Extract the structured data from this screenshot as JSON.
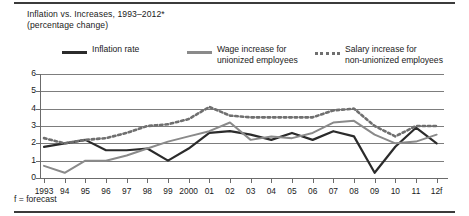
{
  "figure": {
    "title_line1": "Inflation vs. Increases, 1993–2012*",
    "title_line2": "(percentage change)",
    "footnote": "f = forecast"
  },
  "legend": {
    "items": [
      {
        "key": "line-solid-dark",
        "label_line1": "Inflation rate",
        "label_line2": "",
        "color": "#2b2b2b"
      },
      {
        "key": "line-solid-gray",
        "label_line1": "Wage increase for",
        "label_line2": "unionized employees",
        "color": "#8a8a8a"
      },
      {
        "key": "line-dotted-gray",
        "label_line1": "Salary increase for",
        "label_line2": "non-unionized employees",
        "color": "#6f6f6f"
      }
    ]
  },
  "chart_data": {
    "type": "line",
    "title": "Inflation vs. Increases, 1993–2012*",
    "subtitle": "(percentage change)",
    "xlabel": "",
    "ylabel": "",
    "ylim": [
      0,
      6
    ],
    "yticks": [
      0,
      1,
      2,
      3,
      4,
      5,
      6
    ],
    "grid": true,
    "legend_position": "top",
    "categories": [
      "1993",
      "94",
      "95",
      "96",
      "97",
      "98",
      "99",
      "2000",
      "01",
      "02",
      "03",
      "04",
      "05",
      "06",
      "07",
      "08",
      "09",
      "10",
      "11",
      "12f"
    ],
    "x": [
      1993,
      1994,
      1995,
      1996,
      1997,
      1998,
      1999,
      2000,
      2001,
      2002,
      2003,
      2004,
      2005,
      2006,
      2007,
      2008,
      2009,
      2010,
      2011,
      2012
    ],
    "series": [
      {
        "name": "Inflation rate",
        "style": "solid",
        "color": "#2b2b2b",
        "values": [
          1.8,
          2.0,
          2.2,
          1.6,
          1.6,
          1.7,
          1.0,
          1.7,
          2.6,
          2.7,
          2.5,
          2.2,
          2.6,
          2.2,
          2.7,
          2.4,
          0.3,
          1.8,
          2.9,
          2.0
        ]
      },
      {
        "name": "Wage increase for unionized employees",
        "style": "solid",
        "color": "#8a8a8a",
        "values": [
          0.7,
          0.3,
          1.0,
          1.0,
          1.3,
          1.7,
          2.1,
          2.4,
          2.7,
          3.2,
          2.2,
          2.4,
          2.3,
          2.6,
          3.2,
          3.3,
          2.5,
          2.0,
          2.1,
          2.5
        ]
      },
      {
        "name": "Salary increase for non-unionized employees",
        "style": "dotted",
        "color": "#6f6f6f",
        "values": [
          2.3,
          2.0,
          2.2,
          2.3,
          2.6,
          3.0,
          3.1,
          3.4,
          4.1,
          3.6,
          3.5,
          3.5,
          3.5,
          3.5,
          3.9,
          4.0,
          3.0,
          2.4,
          3.0,
          3.0
        ]
      }
    ]
  }
}
